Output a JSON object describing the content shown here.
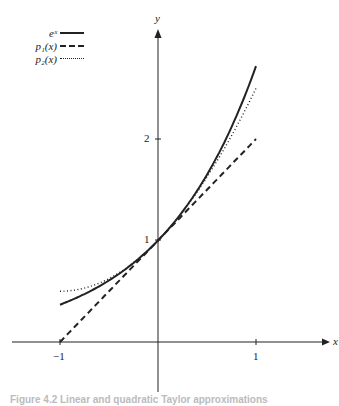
{
  "chart_data": {
    "type": "line",
    "title": "",
    "xlabel": "x",
    "ylabel": "y",
    "xlim": [
      -1.05,
      1.4
    ],
    "ylim": [
      -0.5,
      3.0
    ],
    "grid": false,
    "legend_position": "upper-left",
    "x_ticks": [
      {
        "value": -1,
        "label": "−1"
      },
      {
        "value": 1,
        "label": "1"
      }
    ],
    "y_ticks": [
      {
        "value": 1,
        "label": "1"
      },
      {
        "value": 2,
        "label": "2"
      }
    ],
    "series": [
      {
        "name": "e^x",
        "style": "solid",
        "function": "exp(x)",
        "x": [
          -1,
          -0.5,
          0,
          0.5,
          1
        ],
        "values": [
          0.368,
          0.607,
          1.0,
          1.649,
          2.718
        ]
      },
      {
        "name": "p1(x)",
        "style": "dashed",
        "function": "1 + x",
        "x": [
          -1,
          -0.5,
          0,
          0.5,
          1
        ],
        "values": [
          0,
          0.5,
          1.0,
          1.5,
          2.0
        ]
      },
      {
        "name": "p2(x)",
        "style": "dotted",
        "function": "1 + x + x^2/2",
        "x": [
          -1,
          -0.5,
          0,
          0.5,
          1
        ],
        "values": [
          0.5,
          0.625,
          1.0,
          1.625,
          2.5
        ]
      }
    ]
  },
  "legend": {
    "items": [
      {
        "label": "eˣ",
        "style": "solid"
      },
      {
        "label": "p₁(x)",
        "style": "dashed"
      },
      {
        "label": "p₂(x)",
        "style": "dotted"
      }
    ]
  },
  "axes": {
    "x_label": "x",
    "y_label": "y",
    "x_tick_neg1": "−1",
    "x_tick_1": "1",
    "y_tick_1": "1",
    "y_tick_2": "2"
  },
  "caption": "Figure 4.2   Linear and quadratic Taylor approximations"
}
